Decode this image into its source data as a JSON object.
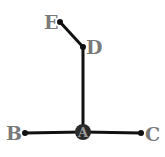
{
  "diagram": {
    "type": "graph",
    "colors": {
      "edge": "#111111",
      "node": "#111111",
      "label": "#7a7a7a",
      "hub_fill": "#2a2a2a"
    },
    "nodes": [
      {
        "id": "A",
        "label": "A",
        "x": 83,
        "y": 132,
        "style": "hub"
      },
      {
        "id": "B",
        "label": "B",
        "x": 25,
        "y": 133
      },
      {
        "id": "C",
        "label": "C",
        "x": 141,
        "y": 133
      },
      {
        "id": "D",
        "label": "D",
        "x": 83,
        "y": 47
      },
      {
        "id": "E",
        "label": "E",
        "x": 60,
        "y": 22
      }
    ],
    "edges": [
      {
        "from": "A",
        "to": "B"
      },
      {
        "from": "A",
        "to": "C"
      },
      {
        "from": "A",
        "to": "D"
      },
      {
        "from": "D",
        "to": "E"
      }
    ]
  },
  "labels": {
    "A": "A",
    "B": "B",
    "C": "C",
    "D": "D",
    "E": "E"
  }
}
